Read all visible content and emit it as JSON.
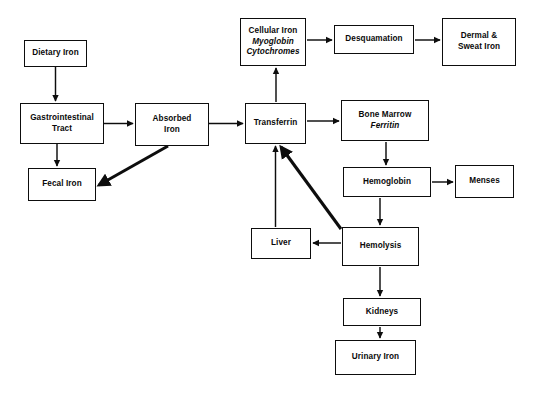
{
  "diagram": {
    "background_color": "#ffffff",
    "stroke_color": "#0d0d0d",
    "text_color": "#0a0a0a",
    "width": 533,
    "height": 395,
    "nodes": [
      {
        "id": "dietary-iron",
        "lines": [
          {
            "text": "Dietary Iron",
            "italic": false
          }
        ],
        "x": 24,
        "y": 40,
        "w": 63,
        "h": 27
      },
      {
        "id": "gastrointestinal-tract",
        "lines": [
          {
            "text": "Gastrointestinal",
            "italic": false
          },
          {
            "text": "Tract",
            "italic": false
          }
        ],
        "x": 20,
        "y": 103,
        "w": 84,
        "h": 41
      },
      {
        "id": "fecal-iron",
        "lines": [
          {
            "text": "Fecal Iron",
            "italic": false
          }
        ],
        "x": 28,
        "y": 168,
        "w": 68,
        "h": 33
      },
      {
        "id": "absorbed-iron",
        "lines": [
          {
            "text": "Absorbed",
            "italic": false
          },
          {
            "text": "Iron",
            "italic": false
          }
        ],
        "x": 135,
        "y": 103,
        "w": 74,
        "h": 43
      },
      {
        "id": "cellular-iron",
        "lines": [
          {
            "text": "Cellular Iron",
            "italic": false
          },
          {
            "text": "Myoglobin",
            "italic": true
          },
          {
            "text": "Cytochromes",
            "italic": true
          }
        ],
        "x": 240,
        "y": 18,
        "w": 66,
        "h": 48
      },
      {
        "id": "transferrin",
        "lines": [
          {
            "text": "Transferrin",
            "italic": false
          }
        ],
        "x": 245,
        "y": 103,
        "w": 61,
        "h": 41
      },
      {
        "id": "desquamation",
        "lines": [
          {
            "text": "Desquamation",
            "italic": false
          }
        ],
        "x": 334,
        "y": 25,
        "w": 80,
        "h": 29
      },
      {
        "id": "dermal-sweat-iron",
        "lines": [
          {
            "text": "Dermal &",
            "italic": false
          },
          {
            "text": "Sweat Iron",
            "italic": false
          }
        ],
        "x": 442,
        "y": 18,
        "w": 74,
        "h": 48
      },
      {
        "id": "bone-marrow",
        "lines": [
          {
            "text": "Bone Marrow",
            "italic": false
          },
          {
            "text": "Ferritin",
            "italic": true
          }
        ],
        "x": 341,
        "y": 100,
        "w": 88,
        "h": 41
      },
      {
        "id": "hemoglobin",
        "lines": [
          {
            "text": "Hemoglobin",
            "italic": false
          }
        ],
        "x": 343,
        "y": 167,
        "w": 88,
        "h": 30
      },
      {
        "id": "menses",
        "lines": [
          {
            "text": "Menses",
            "italic": false
          }
        ],
        "x": 455,
        "y": 165,
        "w": 59,
        "h": 33
      },
      {
        "id": "liver",
        "lines": [
          {
            "text": "Liver",
            "italic": false
          }
        ],
        "x": 251,
        "y": 228,
        "w": 60,
        "h": 31
      },
      {
        "id": "hemolysis",
        "lines": [
          {
            "text": "Hemolysis",
            "italic": false
          }
        ],
        "x": 342,
        "y": 227,
        "w": 77,
        "h": 39
      },
      {
        "id": "kidneys",
        "lines": [
          {
            "text": "Kidneys",
            "italic": false
          }
        ],
        "x": 343,
        "y": 298,
        "w": 78,
        "h": 28
      },
      {
        "id": "urinary-iron",
        "lines": [
          {
            "text": "Urinary Iron",
            "italic": false
          }
        ],
        "x": 335,
        "y": 340,
        "w": 81,
        "h": 35
      }
    ],
    "edges": [
      {
        "id": "dietary-iron-to-gastrointestinal-tract",
        "from": "dietary-iron",
        "to": "gastrointestinal-tract",
        "points": "55.5,67 55.5,101",
        "weight": "thin"
      },
      {
        "id": "gastrointestinal-tract-to-absorbed-iron",
        "from": "gastrointestinal-tract",
        "to": "absorbed-iron",
        "points": "104,123.5 133,123.5",
        "weight": "thin"
      },
      {
        "id": "gastrointestinal-tract-to-fecal-iron",
        "from": "gastrointestinal-tract",
        "to": "fecal-iron",
        "points": "57,144 57,166",
        "weight": "thin"
      },
      {
        "id": "absorbed-iron-to-fecal-iron",
        "from": "absorbed-iron",
        "to": "fecal-iron",
        "points": "168,146 99,185",
        "weight": "thick"
      },
      {
        "id": "absorbed-iron-to-transferrin",
        "from": "absorbed-iron",
        "to": "transferrin",
        "points": "209,123.5 243,123.5",
        "weight": "thin"
      },
      {
        "id": "transferrin-to-cellular-iron",
        "from": "transferrin",
        "to": "cellular-iron",
        "points": "276,102 276,68",
        "weight": "thin"
      },
      {
        "id": "cellular-iron-to-desquamation",
        "from": "cellular-iron",
        "to": "desquamation",
        "points": "307,40 332,40",
        "weight": "thin"
      },
      {
        "id": "desquamation-to-dermal-sweat-iron",
        "from": "desquamation",
        "to": "dermal-sweat-iron",
        "points": "415,40 440,40",
        "weight": "thin"
      },
      {
        "id": "transferrin-to-bone-marrow",
        "from": "transferrin",
        "to": "bone-marrow",
        "points": "307,121 339,121",
        "weight": "thin"
      },
      {
        "id": "bone-marrow-to-hemoglobin",
        "from": "bone-marrow",
        "to": "hemoglobin",
        "points": "386,142 386,165",
        "weight": "thin"
      },
      {
        "id": "hemoglobin-to-menses",
        "from": "hemoglobin",
        "to": "menses",
        "points": "432,182 453,182",
        "weight": "thin"
      },
      {
        "id": "hemoglobin-to-hemolysis",
        "from": "hemoglobin",
        "to": "hemolysis",
        "points": "380,198 380,225",
        "weight": "thin"
      },
      {
        "id": "hemolysis-to-liver",
        "from": "hemolysis",
        "to": "liver",
        "points": "341,243 313,243",
        "weight": "thin"
      },
      {
        "id": "liver-to-transferrin",
        "from": "liver",
        "to": "transferrin",
        "points": "275.5,227 275.5,146",
        "weight": "thin"
      },
      {
        "id": "hemolysis-to-transferrin",
        "from": "hemolysis",
        "to": "transferrin",
        "points": "341,229 281,147",
        "weight": "thick"
      },
      {
        "id": "hemolysis-to-kidneys",
        "from": "hemolysis",
        "to": "kidneys",
        "points": "380,267 380,296",
        "weight": "thin"
      },
      {
        "id": "kidneys-to-urinary-iron",
        "from": "kidneys",
        "to": "urinary-iron",
        "points": "380,327 380,338",
        "weight": "thin"
      }
    ]
  }
}
